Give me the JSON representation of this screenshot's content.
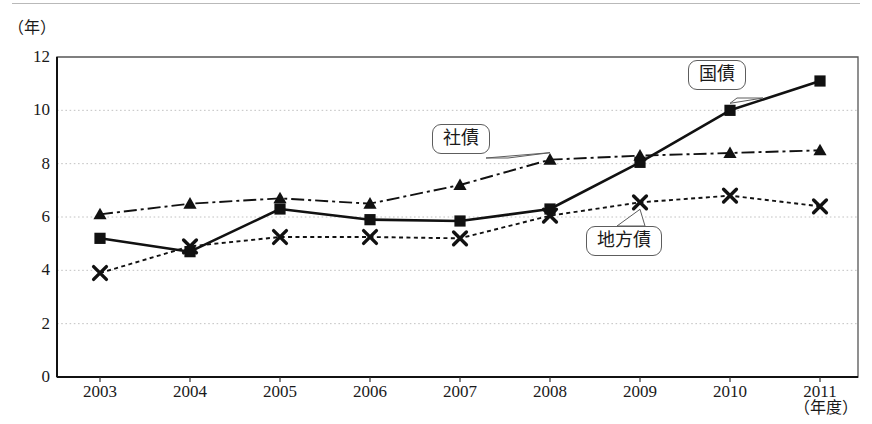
{
  "chart_data": {
    "type": "line",
    "title": "",
    "subtitle": "",
    "xlabel": "（年度）",
    "ylabel": "（年）",
    "categories": [
      "2003",
      "2004",
      "2005",
      "2006",
      "2007",
      "2008",
      "2009",
      "2010",
      "2011"
    ],
    "x_tick_labels": [
      "2003",
      "2004",
      "2005",
      "2006",
      "2007",
      "2008",
      "2009",
      "2010",
      "2011"
    ],
    "y_tick_labels": [
      "0",
      "2",
      "4",
      "6",
      "8",
      "10",
      "12"
    ],
    "y_ticks": [
      0,
      2,
      4,
      6,
      8,
      10,
      12
    ],
    "ylim": [
      0,
      12
    ],
    "grid": "horizontal-dotted",
    "legend_position": "inline-callouts",
    "series": [
      {
        "name": "国債",
        "marker": "square",
        "line_style": "solid",
        "values": [
          5.2,
          4.7,
          6.3,
          5.9,
          5.85,
          6.3,
          8.05,
          10.0,
          11.1
        ]
      },
      {
        "name": "社債",
        "marker": "triangle",
        "line_style": "dash-dot",
        "values": [
          6.1,
          6.5,
          6.7,
          6.5,
          7.2,
          8.15,
          8.3,
          8.4,
          8.5
        ]
      },
      {
        "name": "地方債",
        "marker": "cross",
        "line_style": "dotted",
        "values": [
          3.9,
          4.9,
          5.25,
          5.25,
          5.2,
          6.05,
          6.55,
          6.8,
          6.4
        ]
      }
    ],
    "annotations": [
      {
        "label": "国債",
        "target_series": "国債",
        "target_category": "2010"
      },
      {
        "label": "社債",
        "target_series": "社債",
        "target_category": "2008"
      },
      {
        "label": "地方債",
        "target_series": "地方債",
        "target_category": "2009"
      }
    ]
  }
}
